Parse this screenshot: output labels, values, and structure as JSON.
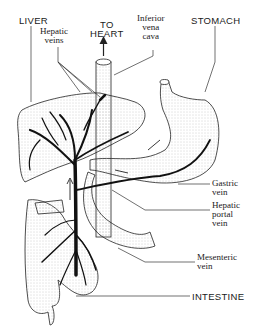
{
  "diagram": {
    "labels": {
      "liver": "LIVER",
      "hepatic_veins": "Hepatic\nveins",
      "to_heart": "TO\nHEART",
      "inferior_vena_cava": "Inferior\nvena\ncava",
      "stomach": "STOMACH",
      "gastric_vein": "Gastric\nvein",
      "hepatic_portal_vein": "Hepatic\nportal\nvein",
      "mesenteric_vein": "Mesenteric\nvein",
      "intestine": "INTESTINE"
    },
    "colors": {
      "ink": "#1a1a1a",
      "stipple": "#bdbdbd",
      "background": "#ffffff"
    }
  }
}
